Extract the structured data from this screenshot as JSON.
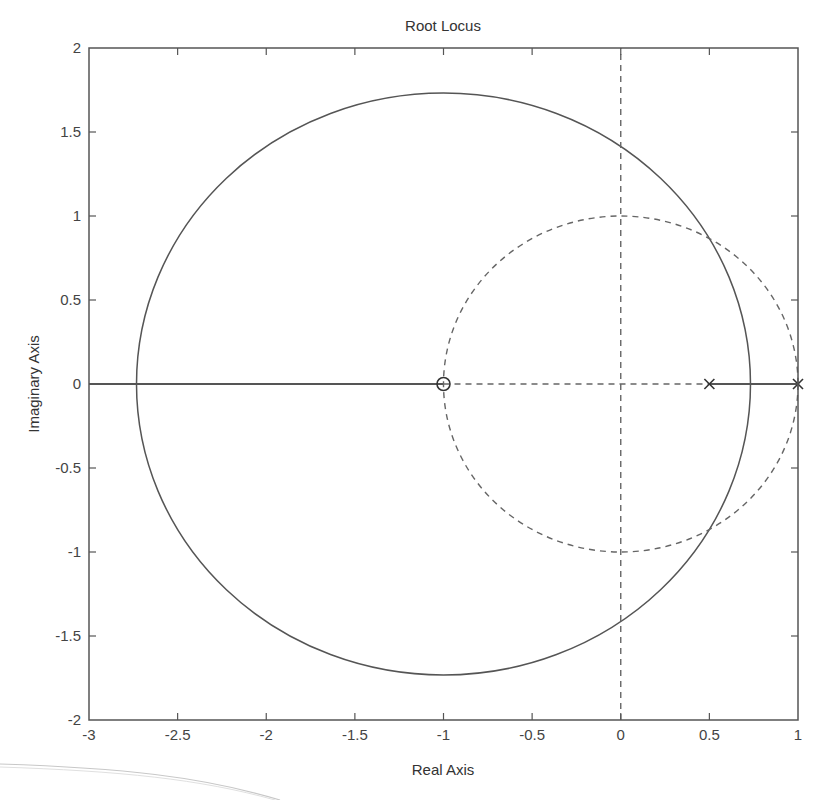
{
  "chart_data": {
    "type": "line",
    "title": "Root Locus",
    "xlabel": "Real Axis",
    "ylabel": "Imaginary Axis",
    "xlim": [
      -3,
      1
    ],
    "ylim": [
      -2,
      2
    ],
    "xticks": [
      -3,
      -2.5,
      -2,
      -1.5,
      -1,
      -0.5,
      0,
      0.5,
      1
    ],
    "xtick_labels": [
      "-3",
      "-2.5",
      "-2",
      "-1.5",
      "-1",
      "-0.5",
      "0",
      "0.5",
      "1"
    ],
    "yticks": [
      -2,
      -1.5,
      -1,
      -0.5,
      0,
      0.5,
      1,
      1.5,
      2
    ],
    "ytick_labels": [
      "-2",
      "-1.5",
      "-1",
      "-0.5",
      "0",
      "0.5",
      "1",
      "1.5",
      "2"
    ],
    "grid": false,
    "legend": null,
    "series": [
      {
        "name": "root locus circle (complex branches)",
        "style": "solid",
        "shape": "circle",
        "center": [
          -1,
          0
        ],
        "radius": 1.732,
        "real_axis_breakpoints": [
          -2.732,
          0.732
        ],
        "imag_axis_crossings": [
          1.414,
          -1.414
        ]
      },
      {
        "name": "real-axis locus segment (left)",
        "style": "solid",
        "x": [
          -3,
          -2.732,
          -1
        ],
        "y": [
          0,
          0,
          0
        ]
      },
      {
        "name": "real-axis locus segment (right)",
        "style": "solid",
        "x": [
          0.5,
          1
        ],
        "y": [
          0,
          0
        ]
      },
      {
        "name": "unit circle (stability boundary)",
        "style": "dashed",
        "shape": "circle",
        "center": [
          0,
          0
        ],
        "radius": 1
      },
      {
        "name": "imaginary axis",
        "style": "dashed",
        "x": [
          0,
          0
        ],
        "y": [
          -2,
          2
        ]
      },
      {
        "name": "real axis segment",
        "style": "dashed",
        "x": [
          -1,
          0.5
        ],
        "y": [
          0,
          0
        ]
      }
    ],
    "markers": {
      "zeros": [
        {
          "x": -1,
          "y": 0,
          "symbol": "o"
        }
      ],
      "poles": [
        {
          "x": 0.5,
          "y": 0,
          "symbol": "x"
        },
        {
          "x": 1,
          "y": 0,
          "symbol": "x"
        }
      ]
    }
  }
}
